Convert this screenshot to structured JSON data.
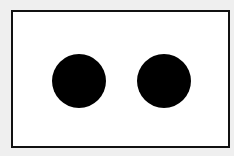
{
  "diagram": {
    "background_color": "#efefef",
    "frame": {
      "fill": "#ffffff",
      "stroke": "#111111"
    },
    "dots": [
      {
        "name": "left-dot",
        "color": "#000000",
        "cx": 79,
        "cy": 81,
        "diameter": 54
      },
      {
        "name": "right-dot",
        "color": "#000000",
        "cx": 164,
        "cy": 81,
        "diameter": 54
      }
    ],
    "dot_count": 2
  }
}
